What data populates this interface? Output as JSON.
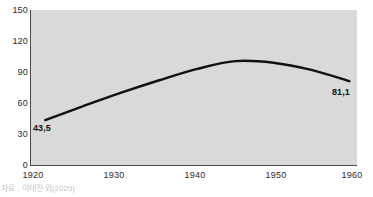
{
  "chart_data": {
    "type": "line",
    "title": "",
    "subtitle": "",
    "xlabel": "",
    "ylabel": "",
    "xlim": [
      1918,
      1961
    ],
    "ylim": [
      0,
      150
    ],
    "grid": false,
    "legend": null,
    "legend_position": "none",
    "x_ticks": [
      "1920",
      "1930",
      "1940",
      "1950",
      "1960"
    ],
    "y_ticks": [
      "0",
      "30",
      "60",
      "90",
      "120",
      "150"
    ],
    "decimal_separator": ",",
    "plot_background_color": "#d9d9d9",
    "line_color": "#111111",
    "series": [
      {
        "name": "series-1",
        "x": [
          1920,
          1925,
          1930,
          1935,
          1940,
          1945,
          1950,
          1955,
          1960
        ],
        "values": [
          43.5,
          57.0,
          70.0,
          82.0,
          93.0,
          100.5,
          99.0,
          92.0,
          81.1
        ]
      }
    ],
    "annotations": [
      {
        "name": "start-value",
        "text": "43,5",
        "x": 1920,
        "y": 43.5
      },
      {
        "name": "end-value",
        "text": "81,1",
        "x": 1960,
        "y": 81.1
      }
    ]
  },
  "caption": {
    "text": "자료 : 이태진 외(2020)"
  }
}
